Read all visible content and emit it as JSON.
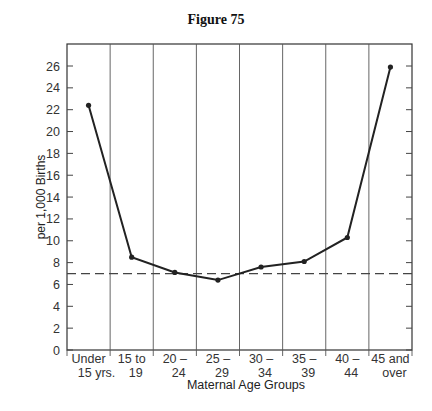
{
  "chart_data": {
    "type": "line",
    "title": "Figure 75",
    "xlabel": "Maternal Age Groups",
    "ylabel": "per 1,000 Births",
    "ylim": [
      0,
      28
    ],
    "yticks": [
      0,
      2,
      4,
      6,
      8,
      10,
      12,
      14,
      16,
      18,
      20,
      22,
      24,
      26
    ],
    "categories": [
      [
        "Under",
        "15 yrs."
      ],
      [
        "15 to",
        "19"
      ],
      [
        "20 –",
        "24"
      ],
      [
        "25 –",
        "29"
      ],
      [
        "30 –",
        "34"
      ],
      [
        "35 –",
        "39"
      ],
      [
        "40 –",
        "44"
      ],
      [
        "45 and",
        "over"
      ]
    ],
    "series": [
      {
        "name": "Rate per 1,000 births",
        "values": [
          22.4,
          8.5,
          7.1,
          6.4,
          7.6,
          8.1,
          10.3,
          25.9
        ]
      }
    ],
    "reference_line": {
      "style": "dashed",
      "value": 7.0
    },
    "grid": {
      "vertical_separators": true,
      "horizontal": false
    },
    "legend": null
  }
}
